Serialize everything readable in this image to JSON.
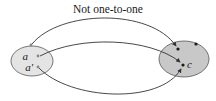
{
  "diagram": {
    "title": "Not one-to-one",
    "domain_set": {
      "fill": "#e4e4e4",
      "stroke": "#555555",
      "points": [
        {
          "label": "",
          "x": 31,
          "y": 45
        },
        {
          "label": "a",
          "x": 38,
          "y": 56
        },
        {
          "label": "a'",
          "x": 38,
          "y": 67
        }
      ]
    },
    "codomain_set": {
      "fill": "#c8c8c8",
      "stroke": "#555555",
      "points": [
        {
          "label": "",
          "x": 178,
          "y": 49
        },
        {
          "label": "",
          "x": 196,
          "y": 44
        },
        {
          "label": "c",
          "x": 183,
          "y": 65
        }
      ]
    },
    "mappings": [
      {
        "from": "top",
        "to": "top-left"
      },
      {
        "from": "a",
        "to": "c"
      },
      {
        "from": "a'",
        "to": "c"
      }
    ],
    "colors": {
      "line": "#333333",
      "point_domain": "#888888",
      "point_codomain": "#1a1a1a"
    }
  }
}
